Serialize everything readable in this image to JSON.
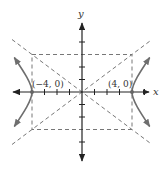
{
  "diagram": {
    "type": "hyperbola-graph",
    "equation_params": {
      "a": 4,
      "b": 3,
      "orientation": "horizontal"
    },
    "axes": {
      "x_label": "x",
      "y_label": "y"
    },
    "vertices": [
      {
        "label": "(−4, 0)",
        "x": -4,
        "y": 0
      },
      {
        "label": "(4, 0)",
        "x": 4,
        "y": 0
      }
    ],
    "asymptotes": [
      {
        "slope": 0.75,
        "style": "dashed"
      },
      {
        "slope": -0.75,
        "style": "dashed"
      }
    ],
    "fundamental_rectangle": {
      "x_min": -4,
      "x_max": 4,
      "y_min": -3,
      "y_max": 3,
      "style": "dashed"
    },
    "ticks": {
      "x": [
        -5,
        -4,
        -3,
        -2,
        -1,
        1,
        2,
        3,
        4,
        5
      ],
      "y": [
        -5,
        -4,
        -3,
        -2,
        -1,
        1,
        2,
        3,
        4,
        5
      ]
    },
    "colors": {
      "axis": "#222222",
      "dashed": "#777777",
      "curve": "#6e6e6e",
      "vertex": "#666666"
    }
  }
}
